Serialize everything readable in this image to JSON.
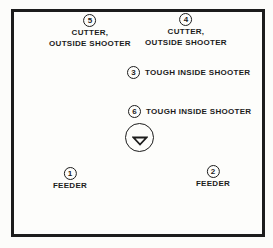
{
  "positions": {
    "p5": {
      "number": "5",
      "line1": "CUTTER,",
      "line2": "OUTSIDE SHOOTER"
    },
    "p4": {
      "number": "4",
      "line1": "CUTTER,",
      "line2": "OUTSIDE SHOOTER"
    },
    "p3": {
      "number": "3",
      "label": "TOUGH INSIDE SHOOTER"
    },
    "p6": {
      "number": "6",
      "label": "TOUGH INSIDE SHOOTER"
    },
    "p1": {
      "number": "1",
      "label": "FEEDER"
    },
    "p2": {
      "number": "2",
      "label": "FEEDER"
    }
  },
  "marker": {
    "icon": "triangle-down-icon"
  },
  "colors": {
    "ink": "#1c1c1c",
    "background": "#fdfdfb"
  }
}
